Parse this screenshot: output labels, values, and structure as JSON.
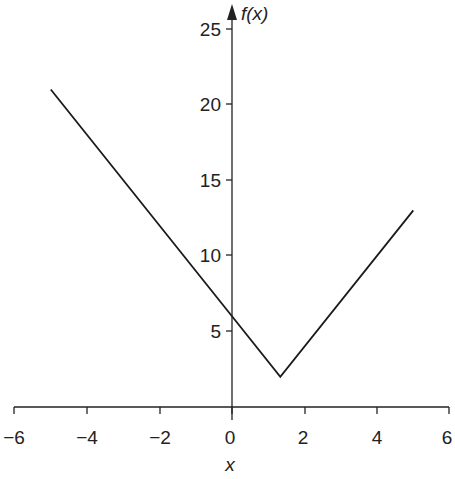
{
  "chart_data": {
    "type": "line",
    "title": "",
    "xlabel": "x",
    "ylabel": "f(x)",
    "xlim": [
      -6,
      6
    ],
    "ylim": [
      0,
      25
    ],
    "grid": false,
    "legend": null,
    "x_ticks": [
      "−6",
      "−4",
      "−2",
      "0",
      "2",
      "4",
      "6"
    ],
    "y_ticks": [
      "5",
      "10",
      "15",
      "20",
      "25"
    ],
    "series": [
      {
        "name": "f(x) = 3|x − 4/3| + 2",
        "x": [
          -5,
          0,
          1.333,
          5
        ],
        "y": [
          21,
          6,
          2,
          13
        ]
      }
    ],
    "annotations": []
  },
  "axes": {
    "x_title": "x",
    "y_title": "f(x)",
    "x_tick_labels": [
      "−6",
      "−4",
      "−2",
      "0",
      "2",
      "4",
      "6"
    ],
    "y_tick_labels": [
      "5",
      "10",
      "15",
      "20",
      "25"
    ]
  }
}
